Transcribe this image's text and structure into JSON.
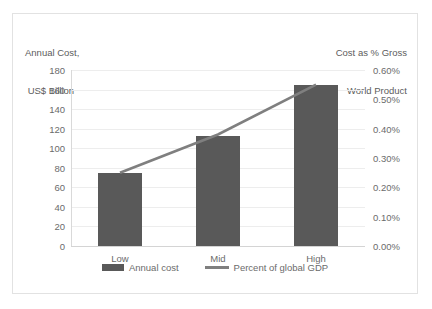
{
  "chart_data": {
    "type": "bar",
    "title": "",
    "categories": [
      "Low",
      "Mid",
      "High"
    ],
    "left_axis": {
      "title_line1": "Annual Cost,",
      "title_line2": " US$ Billion",
      "ticks": [
        "0",
        "20",
        "40",
        "60",
        "80",
        "100",
        "120",
        "140",
        "160",
        "180"
      ],
      "tick_values": [
        0,
        20,
        40,
        60,
        80,
        100,
        120,
        140,
        160,
        180
      ],
      "ylim": [
        0,
        180
      ]
    },
    "right_axis": {
      "title_line1": "Cost as % Gross",
      "title_line2": "World Product",
      "ticks": [
        "0.00%",
        "0.10%",
        "0.20%",
        "0.30%",
        "0.40%",
        "0.50%",
        "0.60%"
      ],
      "tick_values": [
        0.0,
        0.1,
        0.2,
        0.3,
        0.4,
        0.5,
        0.6
      ],
      "ylim": [
        0,
        0.6
      ]
    },
    "series": [
      {
        "name": "Annual cost",
        "type": "bar",
        "axis": "left",
        "color": "#595959",
        "values": [
          75,
          113,
          165
        ]
      },
      {
        "name": "Percent of global GDP",
        "type": "line",
        "axis": "right",
        "color": "#7f7f7f",
        "values": [
          0.25,
          0.38,
          0.55
        ]
      }
    ],
    "legend": {
      "position": "bottom",
      "entries": [
        "Annual cost",
        "Percent of global GDP"
      ]
    },
    "grid": true,
    "xlabel": "",
    "ylabel": "Annual Cost, US$ Billion"
  },
  "colors": {
    "bar": "#595959",
    "line": "#7f7f7f",
    "grid": "#ededed",
    "border": "#e2e2e2",
    "text": "#6b6b6b"
  }
}
